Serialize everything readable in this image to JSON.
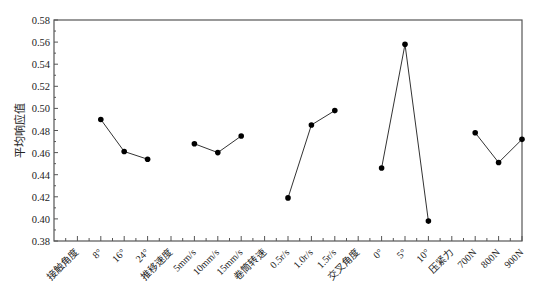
{
  "chart_data": {
    "type": "line",
    "title": "",
    "xlabel": "",
    "ylabel": "平均响应值",
    "ylim": [
      0.38,
      0.58
    ],
    "yticks": [
      "0.38",
      "0.40",
      "0.42",
      "0.44",
      "0.46",
      "0.48",
      "0.50",
      "0.52",
      "0.54",
      "0.56",
      "0.58"
    ],
    "grid": false,
    "legend": null,
    "x_slots": [
      {
        "label": "接触角度",
        "kind": "factor"
      },
      {
        "label": "8°",
        "kind": "level"
      },
      {
        "label": "16°",
        "kind": "level"
      },
      {
        "label": "24°",
        "kind": "level"
      },
      {
        "label": "推移速度",
        "kind": "factor"
      },
      {
        "label": "5mm/s",
        "kind": "level"
      },
      {
        "label": "10mm/s",
        "kind": "level"
      },
      {
        "label": "15mm/s",
        "kind": "level"
      },
      {
        "label": "卷筒转速",
        "kind": "factor"
      },
      {
        "label": "0.5r/s",
        "kind": "level"
      },
      {
        "label": "1.0r/s",
        "kind": "level"
      },
      {
        "label": "1.5r/s",
        "kind": "level"
      },
      {
        "label": "交叉角度",
        "kind": "factor"
      },
      {
        "label": "0°",
        "kind": "level"
      },
      {
        "label": "5°",
        "kind": "level"
      },
      {
        "label": "10°",
        "kind": "level"
      },
      {
        "label": "压紧力",
        "kind": "factor"
      },
      {
        "label": "700N",
        "kind": "level"
      },
      {
        "label": "800N",
        "kind": "level"
      },
      {
        "label": "900N",
        "kind": "level"
      }
    ],
    "series": [
      {
        "name": "接触角度",
        "categories": [
          "8°",
          "16°",
          "24°"
        ],
        "values": [
          0.49,
          0.461,
          0.454
        ]
      },
      {
        "name": "推移速度",
        "categories": [
          "5mm/s",
          "10mm/s",
          "15mm/s"
        ],
        "values": [
          0.468,
          0.46,
          0.475
        ]
      },
      {
        "name": "卷筒转速",
        "categories": [
          "0.5r/s",
          "1.0r/s",
          "1.5r/s"
        ],
        "values": [
          0.419,
          0.485,
          0.498
        ]
      },
      {
        "name": "交叉角度",
        "categories": [
          "0°",
          "5°",
          "10°"
        ],
        "values": [
          0.446,
          0.558,
          0.398
        ]
      },
      {
        "name": "压紧力",
        "categories": [
          "700N",
          "800N",
          "900N"
        ],
        "values": [
          0.478,
          0.451,
          0.472
        ]
      }
    ],
    "colors": {
      "line": "#333333",
      "marker": "#000000",
      "axis": "#555555"
    }
  }
}
